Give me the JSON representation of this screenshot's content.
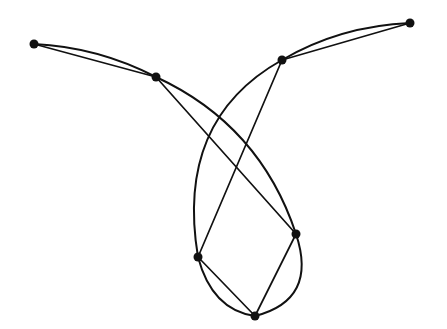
{
  "diagram": {
    "type": "graph",
    "style": {
      "line_color": "#111111",
      "background": "#ffffff",
      "node_radius": 4.5
    },
    "nodes": [
      {
        "id": "n1",
        "x": 34,
        "y": 44
      },
      {
        "id": "n2",
        "x": 156,
        "y": 77
      },
      {
        "id": "n3",
        "x": 282,
        "y": 60
      },
      {
        "id": "n4",
        "x": 410,
        "y": 23
      },
      {
        "id": "n5",
        "x": 296,
        "y": 234
      },
      {
        "id": "n6",
        "x": 198,
        "y": 257
      },
      {
        "id": "n7",
        "x": 255,
        "y": 316
      }
    ],
    "edges": [
      {
        "from": "n1",
        "to": "n2",
        "kind": "straight"
      },
      {
        "from": "n1",
        "to": "n2",
        "kind": "curved",
        "path": "M34,44 Q98,47 156,77"
      },
      {
        "from": "n2",
        "to": "n5",
        "kind": "straight"
      },
      {
        "from": "n2",
        "to": "n5",
        "kind": "curved",
        "path": "M156,77 Q260,125 296,234"
      },
      {
        "from": "n5",
        "to": "n7",
        "kind": "straight"
      },
      {
        "from": "n5",
        "to": "n7",
        "kind": "curved",
        "path": "M296,234 Q318,300 255,316"
      },
      {
        "from": "n6",
        "to": "n7",
        "kind": "straight"
      },
      {
        "from": "n6",
        "to": "n7",
        "kind": "curved",
        "path": "M198,257 Q212,310 255,316"
      },
      {
        "from": "n3",
        "to": "n6",
        "kind": "straight"
      },
      {
        "from": "n3",
        "to": "n6",
        "kind": "curved",
        "path": "M282,60 Q175,120 198,257"
      },
      {
        "from": "n3",
        "to": "n4",
        "kind": "straight"
      },
      {
        "from": "n3",
        "to": "n4",
        "kind": "curved",
        "path": "M282,60 Q340,26 410,23"
      }
    ]
  }
}
